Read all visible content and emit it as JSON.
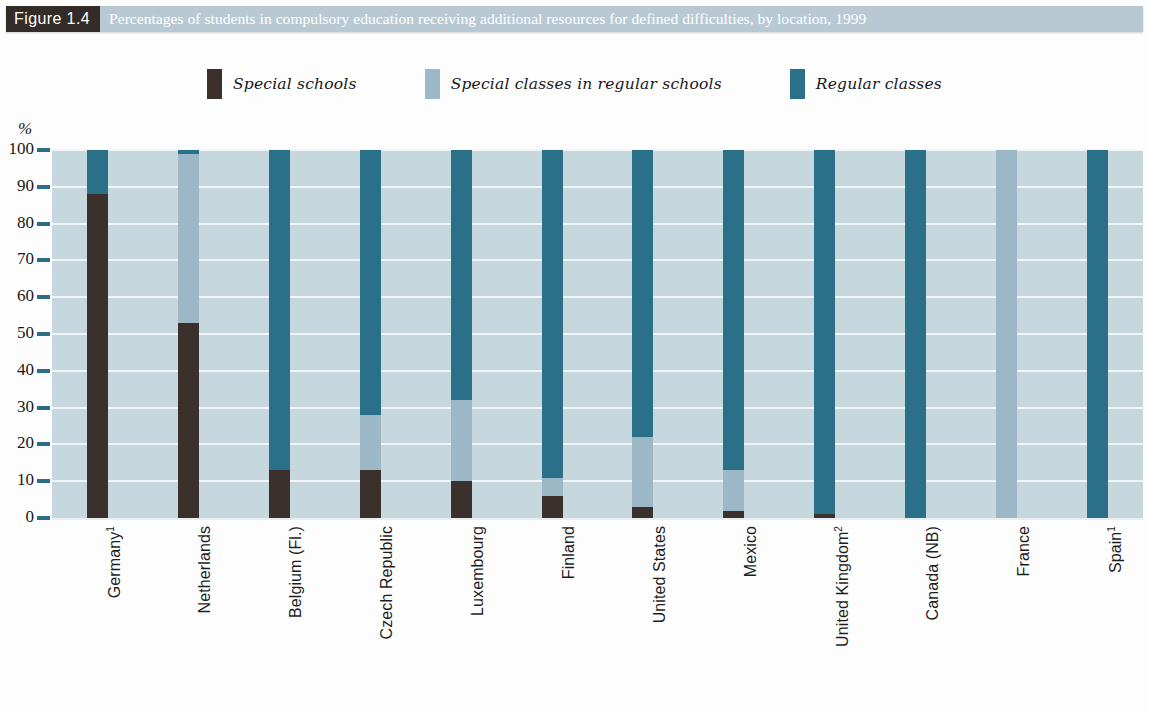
{
  "figure": {
    "number_label": "Figure 1.4",
    "title": "Percentages of students in compulsory education receiving additional resources for defined difficulties, by location, 1999",
    "title_bar_bg": "#b9c9d3",
    "number_bg": "#332b28"
  },
  "legend": {
    "items": [
      {
        "label": "Special schools",
        "color": "#3b302c"
      },
      {
        "label": "Special classes in regular schools",
        "color": "#9cb8c6"
      },
      {
        "label": "Regular classes",
        "color": "#2b7089"
      }
    ]
  },
  "axis": {
    "y_unit": "%",
    "y_ticks": [
      "100",
      "90",
      "80",
      "70",
      "60",
      "50",
      "40",
      "30",
      "20",
      "10",
      "0"
    ]
  },
  "chart_data": {
    "type": "bar",
    "stacked": true,
    "title": "Percentages of students in compulsory education receiving additional resources for defined difficulties, by location, 1999",
    "xlabel": "",
    "ylabel": "%",
    "ylim": [
      0,
      100
    ],
    "grid": true,
    "legend_position": "top-center",
    "plot_background": "#c6d8de",
    "gridline_color": "#f2f7f8",
    "categories": [
      "Germany¹",
      "Netherlands",
      "Belgium (Fl.)",
      "Czech Republic",
      "Luxembourg",
      "Finland",
      "United States",
      "Mexico",
      "United Kingdom²",
      "Canada (NB)",
      "France",
      "Spain¹"
    ],
    "series": [
      {
        "name": "Special schools",
        "color": "#3b302c",
        "values": [
          88,
          53,
          13,
          13,
          10,
          6,
          3,
          2,
          1,
          0,
          0,
          0
        ]
      },
      {
        "name": "Special classes in regular schools",
        "color": "#9cb8c6",
        "values": [
          0,
          46,
          0,
          15,
          22,
          5,
          19,
          11,
          0,
          0,
          100,
          0
        ]
      },
      {
        "name": "Regular classes",
        "color": "#2b7089",
        "values": [
          12,
          1,
          87,
          72,
          68,
          89,
          78,
          87,
          99,
          100,
          0,
          100
        ]
      }
    ]
  }
}
